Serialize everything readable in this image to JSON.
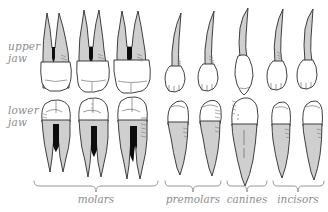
{
  "figure": {
    "background_color": "#ffffff",
    "outline_color": "#2b2b2b",
    "root_fill_color": "#cfcfcf",
    "crown_fill_color": "#ffffff",
    "pulp_fill_color": "#0d0d0d",
    "label_color": "#8d8d8d"
  },
  "row_labels": {
    "upper": "upper\njaw",
    "lower": "lower\njaw"
  },
  "groups": [
    {
      "id": "molars",
      "label": "molars",
      "count": 3,
      "brace_x1": 34,
      "brace_x2": 158,
      "label_x": 96
    },
    {
      "id": "premolars",
      "label": "premolars",
      "count": 2,
      "brace_x1": 165,
      "brace_x2": 221,
      "label_x": 193
    },
    {
      "id": "canines",
      "label": "canines",
      "count": 1,
      "brace_x1": 227,
      "brace_x2": 267,
      "label_x": 247
    },
    {
      "id": "incisors",
      "label": "incisors",
      "count": 2,
      "brace_x1": 273,
      "brace_x2": 324,
      "label_x": 298
    }
  ],
  "teeth": [
    {
      "id": "upper-molar-1",
      "jaw": "upper",
      "group": "molars",
      "index": 1,
      "roots": 3,
      "has_pulp": true
    },
    {
      "id": "upper-molar-2",
      "jaw": "upper",
      "group": "molars",
      "index": 2,
      "roots": 3,
      "has_pulp": true
    },
    {
      "id": "upper-molar-3",
      "jaw": "upper",
      "group": "molars",
      "index": 3,
      "roots": 3,
      "has_pulp": true
    },
    {
      "id": "upper-premolar-1",
      "jaw": "upper",
      "group": "premolars",
      "index": 1,
      "roots": 1,
      "has_pulp": false
    },
    {
      "id": "upper-premolar-2",
      "jaw": "upper",
      "group": "premolars",
      "index": 2,
      "roots": 1,
      "has_pulp": false
    },
    {
      "id": "upper-canine-1",
      "jaw": "upper",
      "group": "canines",
      "index": 1,
      "roots": 1,
      "has_pulp": false
    },
    {
      "id": "upper-incisor-1",
      "jaw": "upper",
      "group": "incisors",
      "index": 1,
      "roots": 1,
      "has_pulp": false
    },
    {
      "id": "upper-incisor-2",
      "jaw": "upper",
      "group": "incisors",
      "index": 2,
      "roots": 1,
      "has_pulp": false
    },
    {
      "id": "lower-molar-1",
      "jaw": "lower",
      "group": "molars",
      "index": 1,
      "roots": 2,
      "has_pulp": true
    },
    {
      "id": "lower-molar-2",
      "jaw": "lower",
      "group": "molars",
      "index": 2,
      "roots": 2,
      "has_pulp": true
    },
    {
      "id": "lower-molar-3",
      "jaw": "lower",
      "group": "molars",
      "index": 3,
      "roots": 2,
      "has_pulp": true
    },
    {
      "id": "lower-premolar-1",
      "jaw": "lower",
      "group": "premolars",
      "index": 1,
      "roots": 1,
      "has_pulp": false
    },
    {
      "id": "lower-premolar-2",
      "jaw": "lower",
      "group": "premolars",
      "index": 2,
      "roots": 1,
      "has_pulp": false
    },
    {
      "id": "lower-canine-1",
      "jaw": "lower",
      "group": "canines",
      "index": 1,
      "roots": 1,
      "has_pulp": false
    },
    {
      "id": "lower-incisor-1",
      "jaw": "lower",
      "group": "incisors",
      "index": 1,
      "roots": 1,
      "has_pulp": false
    },
    {
      "id": "lower-incisor-2",
      "jaw": "lower",
      "group": "incisors",
      "index": 2,
      "roots": 1,
      "has_pulp": false
    }
  ]
}
